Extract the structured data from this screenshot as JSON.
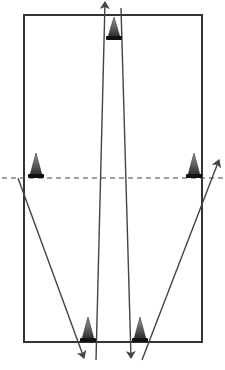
{
  "diagram": {
    "type": "drill-field",
    "width": 225,
    "height": 370,
    "colors": {
      "background": "#ffffff",
      "field_border": "#333333",
      "line": "#444444",
      "dashed_line": "#444444",
      "cone_light": "#9a9a9a",
      "cone_dark": "#2a2a2a",
      "cone_base": "#111111"
    },
    "field": {
      "x": 24,
      "y": 15,
      "width": 178,
      "height": 327
    },
    "midline": {
      "y": 178,
      "x1": 2,
      "x2": 225,
      "style": "dashed"
    },
    "cones": [
      {
        "id": "top-center",
        "tip_x": 114,
        "tip_y": 17,
        "base_y": 40,
        "half_width": 8
      },
      {
        "id": "mid-left",
        "tip_x": 36,
        "tip_y": 153,
        "base_y": 178,
        "half_width": 8
      },
      {
        "id": "mid-right",
        "tip_x": 194,
        "tip_y": 153,
        "base_y": 178,
        "half_width": 8
      },
      {
        "id": "bottom-left",
        "tip_x": 88,
        "tip_y": 317,
        "base_y": 342,
        "half_width": 8
      },
      {
        "id": "bottom-right",
        "tip_x": 140,
        "tip_y": 317,
        "base_y": 342,
        "half_width": 8
      }
    ],
    "paths": [
      {
        "id": "up-run-center-left",
        "x1": 96,
        "y1": 360,
        "x2": 105,
        "y2": 2,
        "arrow": "end"
      },
      {
        "id": "down-run-center-right",
        "x1": 121,
        "y1": 8,
        "x2": 131,
        "y2": 358,
        "arrow": "end"
      },
      {
        "id": "diagonal-left",
        "x1": 18,
        "y1": 178,
        "x2": 84,
        "y2": 358,
        "arrow": "end"
      },
      {
        "id": "diagonal-right",
        "x1": 142,
        "y1": 360,
        "x2": 219,
        "y2": 160,
        "arrow": "end"
      }
    ]
  }
}
